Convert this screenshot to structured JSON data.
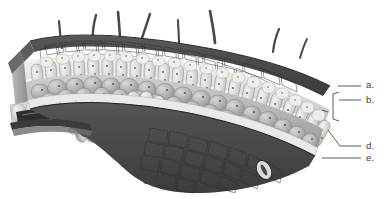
{
  "figure": {
    "background_color": "#ffffff",
    "ink_color": "#3a3a3a"
  },
  "labels": [
    {
      "id": "a",
      "text": "a.",
      "x": 366,
      "y": 84,
      "leader": "straight-line",
      "meaning": "upper epidermis / cuticle"
    },
    {
      "id": "b",
      "text": "b.",
      "x": 366,
      "y": 100,
      "leader": "bracket",
      "meaning": "palisade mesophyll"
    },
    {
      "id": "c",
      "text": "c.",
      "x": 145,
      "y": 181,
      "leader": "bracket-down",
      "meaning": "vascular bundle (vein)"
    },
    {
      "id": "d",
      "text": "d.",
      "x": 366,
      "y": 142,
      "leader": "straight-line",
      "meaning": "spongy mesophyll"
    },
    {
      "id": "e",
      "text": "e.",
      "x": 366,
      "y": 160,
      "leader": "straight-line",
      "meaning": "lower epidermis"
    }
  ],
  "structures": {
    "trichomes_count": 8,
    "stomata_count": 2,
    "vascular_bundles_count": 2,
    "layers": [
      "upper epidermis",
      "palisade mesophyll",
      "spongy mesophyll",
      "lower epidermis"
    ]
  },
  "palette": {
    "upper_epidermis_dark": "#4b4b4b",
    "upper_epidermis_darker": "#3b3b3b",
    "palisade_light": "#e9e9e6",
    "palisade_shadow": "#c9c9c6",
    "spongy_mid": "#b4b4b1",
    "spongy_shadow": "#8e8e8c",
    "lower_epidermis_light": "#e6e6e3",
    "lower_surface_dark": "#4a4a4a",
    "chloroplast_dot": "#5a5a5a",
    "hair_color": "#4a4a4a",
    "vein_core": "#3c3c3c"
  }
}
